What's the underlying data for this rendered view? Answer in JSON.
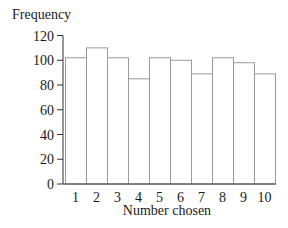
{
  "chart_data": {
    "type": "bar",
    "title": "",
    "xlabel": "Number chosen",
    "ylabel": "Frequency",
    "categories": [
      "1",
      "2",
      "3",
      "4",
      "5",
      "6",
      "7",
      "8",
      "9",
      "10"
    ],
    "values": [
      102,
      110,
      102,
      85,
      102,
      100,
      89,
      102,
      98,
      89
    ],
    "ylim": [
      0,
      120
    ],
    "yticks": [
      0,
      20,
      40,
      60,
      80,
      100,
      120
    ],
    "grid": false,
    "legend": null,
    "bar_style": "outlined, no gaps (histogram style)"
  },
  "colors": {
    "bar_fill": "#ffffff",
    "bar_stroke": "#9a9a9a",
    "axis": "#333333",
    "text": "#1a1a1a"
  }
}
